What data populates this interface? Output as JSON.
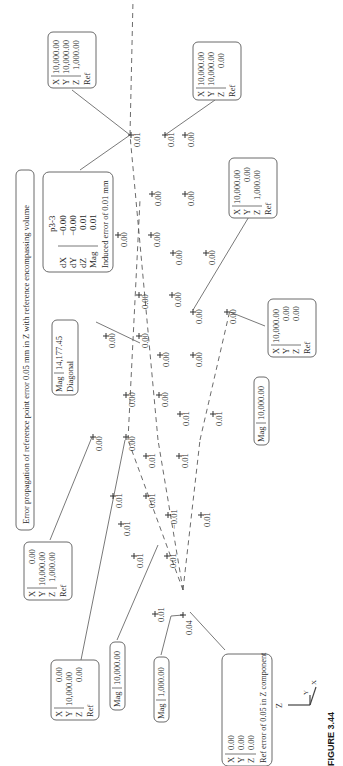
{
  "figure": {
    "caption": "FIGURE 3.44",
    "title": "Error propagation of reference point error 0.05 mm in Z with reference encompassing volume",
    "axis_triad": {
      "labels": [
        "Z",
        "Y",
        "X"
      ]
    },
    "reference_boxes": [
      {
        "id": "ref-origin",
        "rows": [
          [
            "X",
            "0.00"
          ],
          [
            "Y",
            "0.00"
          ],
          [
            "Z",
            "0.00"
          ]
        ],
        "note": "Ref error of 0.05 in Z component"
      },
      {
        "id": "ref-x",
        "rows": [
          [
            "X",
            "10,000.00"
          ],
          [
            "Y",
            "0.00"
          ],
          [
            "Z",
            "0.00"
          ]
        ],
        "note": "Ref"
      },
      {
        "id": "ref-xz",
        "rows": [
          [
            "X",
            "10,000.00"
          ],
          [
            "Y",
            "0.00"
          ],
          [
            "Z",
            "1,000.00"
          ]
        ],
        "note": "Ref"
      },
      {
        "id": "ref-xy",
        "rows": [
          [
            "X",
            "10,000.00"
          ],
          [
            "Y",
            "10,000.00"
          ],
          [
            "Z",
            "0.00"
          ]
        ],
        "note": "Ref"
      },
      {
        "id": "ref-xyz",
        "rows": [
          [
            "X",
            "10,000.00"
          ],
          [
            "Y",
            "10,000.00"
          ],
          [
            "Z",
            "1,000.00"
          ]
        ],
        "note": "Ref"
      },
      {
        "id": "ref-yz",
        "rows": [
          [
            "X",
            "0.00"
          ],
          [
            "Y",
            "10,000.00"
          ],
          [
            "Z",
            "1,000.00"
          ]
        ],
        "note": "Ref"
      },
      {
        "id": "ref-y",
        "rows": [
          [
            "X",
            "0.00"
          ],
          [
            "Y",
            "10,000.00"
          ],
          [
            "Z",
            "0.00"
          ]
        ],
        "note": "Ref"
      }
    ],
    "mag_labels": [
      {
        "id": "mag-1000",
        "label": "Mag",
        "value": "1,000.00"
      },
      {
        "id": "mag-10000-a",
        "label": "Mag",
        "value": "10,000.00"
      },
      {
        "id": "mag-10000-b",
        "label": "Mag",
        "value": "10,000.00"
      },
      {
        "id": "mag-diag",
        "label": "Mag",
        "value": "14,177.45",
        "note": "Diagonal"
      }
    ],
    "point_info": {
      "name": "p3-3",
      "rows": [
        [
          "dX",
          "−0.00"
        ],
        [
          "dY",
          "−0.00"
        ],
        [
          "dZ",
          "0.01"
        ],
        [
          "Mag",
          "0.01"
        ]
      ],
      "note": "Induced error of 0.01 mm"
    },
    "points": [
      {
        "value": "0.04"
      },
      {
        "value": "0.01"
      },
      {
        "value": "0.01"
      },
      {
        "value": "0.01"
      },
      {
        "value": "0.01"
      },
      {
        "value": "−0.01"
      },
      {
        "value": "0.01"
      },
      {
        "value": "0.01"
      },
      {
        "value": "0.01"
      },
      {
        "value": "0.01"
      },
      {
        "value": "0.01"
      },
      {
        "value": "0.01"
      },
      {
        "value": "0.01"
      },
      {
        "value": "0.00"
      },
      {
        "value": "0.00"
      },
      {
        "value": "0.00"
      },
      {
        "value": "0.00"
      },
      {
        "value": "0.00"
      },
      {
        "value": "0.00"
      },
      {
        "value": "0.00"
      },
      {
        "value": "0.00"
      },
      {
        "value": "0.00"
      },
      {
        "value": "0.00"
      },
      {
        "value": "0.00"
      },
      {
        "value": "0.00"
      },
      {
        "value": "0.00"
      },
      {
        "value": "0.00"
      },
      {
        "value": "0.00"
      },
      {
        "value": "0.00"
      },
      {
        "value": "0.00"
      },
      {
        "value": "0.00"
      },
      {
        "value": "0.00"
      },
      {
        "value": "0.01"
      },
      {
        "value": "0.01"
      }
    ]
  }
}
